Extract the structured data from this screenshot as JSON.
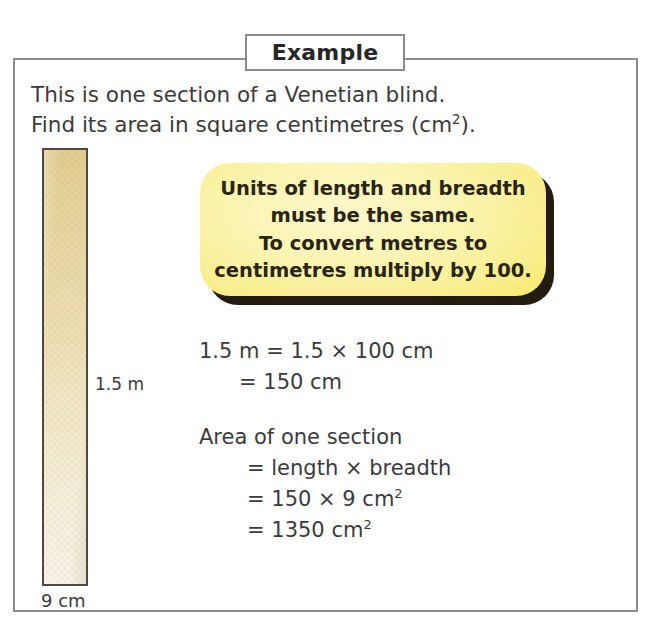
{
  "example": {
    "title": "Example",
    "intro_lines": [
      "This is one section of a Venetian blind.",
      "Find its area in square centimetres (cm²)."
    ],
    "intro_line_1": "This is one section of a Venetian blind.",
    "intro_line_2_prefix": "Find its area in square centimetres (cm",
    "intro_line_2_sup": "2",
    "intro_line_2_suffix": ")."
  },
  "figure": {
    "shape_name": "venetian-blind-section",
    "height_label": "1.5 m",
    "width_label": "9 cm",
    "fill_top_color": "#e2cd8f",
    "fill_bottom_color": "#f8f4ea",
    "border_color": "#4e4a3f"
  },
  "callout": {
    "lines": [
      "Units of length and breadth",
      "must be the same.",
      "To convert metres to",
      "centimetres multiply by 100."
    ],
    "background_color": "#f6e758",
    "shadow_color": "#241c10",
    "text_color": "#2a2414"
  },
  "solution": {
    "conversion": {
      "line_1": "1.5 m = 1.5 × 100 cm",
      "line_2": "= 150 cm"
    },
    "area": {
      "heading": "Area of one section",
      "line_1": "= length × breadth",
      "line_2_prefix": "= 150 × 9 cm",
      "line_2_sup": "2",
      "line_3_prefix": "= 1350 cm",
      "line_3_sup": "2"
    }
  },
  "theme": {
    "frame_border_color": "#8b8b8b",
    "body_text_color": "#3b3b3b",
    "page_background": "#ffffff"
  }
}
